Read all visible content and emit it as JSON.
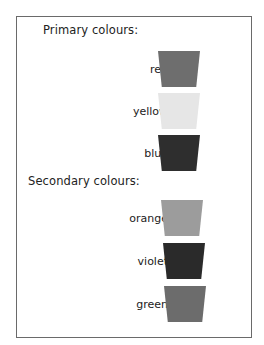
{
  "sections": [
    {
      "heading": "Primary colours:",
      "items": [
        {
          "label": "red",
          "swatch_color": "#6e6e6e"
        },
        {
          "label": "yellow",
          "swatch_color": "#e6e6e6"
        },
        {
          "label": "blue",
          "swatch_color": "#2e2e2e"
        }
      ]
    },
    {
      "heading": "Secondary colours:",
      "items": [
        {
          "label": "orange",
          "swatch_color": "#9c9c9c"
        },
        {
          "label": "violet",
          "swatch_color": "#2a2a2a"
        },
        {
          "label": "green",
          "swatch_color": "#6c6c6c"
        }
      ]
    }
  ]
}
